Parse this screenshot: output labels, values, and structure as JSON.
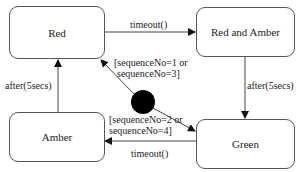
{
  "states": {
    "red": "Red",
    "red_amber": "Red and Amber",
    "amber": "Amber",
    "green": "Green"
  },
  "transitions": {
    "red_to_red_amber": "timeout()",
    "red_amber_to_green": "after(5secs)",
    "green_to_amber": "timeout()",
    "amber_to_red": "after(5secs)",
    "initial_to_red_line1": "[sequenceNo=1 or",
    "initial_to_red_line2": "sequenceNo=3]",
    "initial_to_green_line1": "[sequenceNo=2 or",
    "initial_to_green_line2": "sequenceNo=4]"
  }
}
